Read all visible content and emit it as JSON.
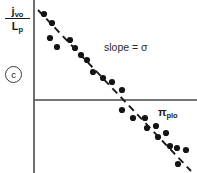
{
  "figure": {
    "panel_letter": "c",
    "annotation": "slope = σ",
    "y_axis": {
      "numerator": "j",
      "numerator_sub": "vo",
      "denominator": "L",
      "denominator_sub": "p"
    },
    "x_axis": {
      "symbol": "π",
      "subscript": "plo"
    },
    "colors": {
      "axis": "#4a4a4a",
      "point": "#141414",
      "fit_line": "#1a1a1a",
      "text": "#1a1a1a",
      "background": "#ffffff"
    }
  },
  "chart_data": {
    "type": "scatter",
    "title": "",
    "subtitle": "",
    "xlabel": "π_plo",
    "ylabel": "j_vo / L_p",
    "annotations": [
      {
        "text": "slope = σ",
        "x": 104,
        "y": 46
      },
      {
        "text": "c",
        "x": 13,
        "y": 74
      }
    ],
    "grid": false,
    "legend": null,
    "axis_origin_px": {
      "x": 34,
      "y": 100
    },
    "xlim_px": [
      34,
      197
    ],
    "ylim_px": [
      0,
      173
    ],
    "tick_labels": {
      "x": [],
      "y": []
    },
    "points_px": [
      {
        "x": 44,
        "y": 14
      },
      {
        "x": 52,
        "y": 23
      },
      {
        "x": 50,
        "y": 38
      },
      {
        "x": 57,
        "y": 47
      },
      {
        "x": 70,
        "y": 40
      },
      {
        "x": 75,
        "y": 48
      },
      {
        "x": 81,
        "y": 55
      },
      {
        "x": 87,
        "y": 60
      },
      {
        "x": 93,
        "y": 72
      },
      {
        "x": 103,
        "y": 78
      },
      {
        "x": 112,
        "y": 82
      },
      {
        "x": 122,
        "y": 90
      },
      {
        "x": 122,
        "y": 110
      },
      {
        "x": 133,
        "y": 118
      },
      {
        "x": 145,
        "y": 118
      },
      {
        "x": 147,
        "y": 128
      },
      {
        "x": 156,
        "y": 126
      },
      {
        "x": 158,
        "y": 137
      },
      {
        "x": 166,
        "y": 133
      },
      {
        "x": 170,
        "y": 146
      },
      {
        "x": 177,
        "y": 148
      },
      {
        "x": 186,
        "y": 150
      },
      {
        "x": 178,
        "y": 164
      }
    ],
    "fit_line_px": {
      "x1": 38,
      "y1": 10,
      "x2": 191,
      "y2": 171
    },
    "fit_line_style": "dashed",
    "series": [
      {
        "name": "measured flux ratio",
        "n_points": 23,
        "trend": "negative linear"
      }
    ]
  }
}
